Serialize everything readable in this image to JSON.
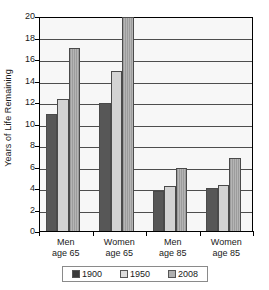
{
  "chart_data": {
    "type": "bar",
    "title": "",
    "xlabel": "",
    "ylabel": "Years of Life Remaining",
    "ylim": [
      0,
      20
    ],
    "ytick_step": 2,
    "yticks": [
      0,
      2,
      4,
      6,
      8,
      10,
      12,
      14,
      16,
      18,
      20
    ],
    "ytick_labels": [
      "0",
      "2",
      "4",
      "6",
      "8",
      "10",
      "12",
      "14",
      "16",
      "18",
      "20"
    ],
    "grid": true,
    "legend_position": "bottom",
    "categories": [
      "Men age 65",
      "Women age 65",
      "Men age 85",
      "Women age 85"
    ],
    "category_lines": [
      [
        "Men",
        "age 65"
      ],
      [
        "Women",
        "age 65"
      ],
      [
        "Men",
        "age 85"
      ],
      [
        "Women",
        "age 85"
      ]
    ],
    "series": [
      {
        "name": "1900",
        "color": "#575757",
        "values": [
          11.0,
          12.0,
          3.8,
          4.1
        ]
      },
      {
        "name": "1950",
        "color": "#d3d3d3",
        "values": [
          12.4,
          15.0,
          4.3,
          4.4
        ]
      },
      {
        "name": "2008",
        "color": "#a8a8a8",
        "values": [
          17.1,
          20.0,
          6.0,
          6.9
        ]
      }
    ]
  },
  "legend": {
    "items": [
      {
        "label": "1900",
        "swatch": "dark-gray-swatch"
      },
      {
        "label": "1950",
        "swatch": "light-gray-swatch"
      },
      {
        "label": "2008",
        "swatch": "medium-gray-swatch"
      }
    ]
  }
}
